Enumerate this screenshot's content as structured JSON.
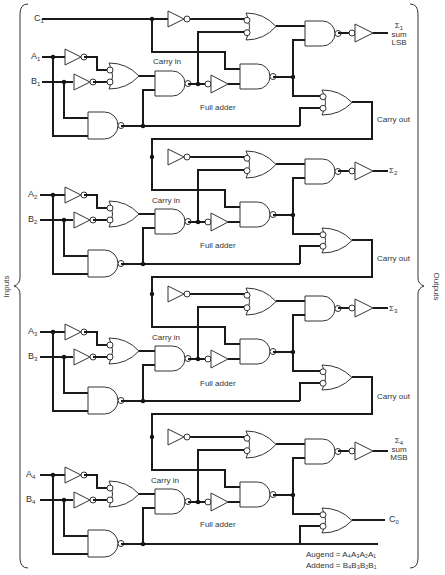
{
  "diagram": {
    "side_labels": {
      "left": "Inputs",
      "right": "Outputs"
    },
    "carry_input": {
      "name": "C",
      "sub": "1"
    },
    "stages": [
      {
        "a": {
          "name": "A",
          "sub": "1"
        },
        "b": {
          "name": "B",
          "sub": "1"
        },
        "carry_in_label": "Carry in",
        "block_label": "Full adder",
        "sum": {
          "symbol": "Σ",
          "sub": "1",
          "line2": "sum",
          "line3": "LSB"
        },
        "carry_out_label": "Carry out"
      },
      {
        "a": {
          "name": "A",
          "sub": "2"
        },
        "b": {
          "name": "B",
          "sub": "2"
        },
        "carry_in_label": "Carry in",
        "block_label": "Full adder",
        "sum": {
          "symbol": "Σ",
          "sub": "2",
          "line2": "",
          "line3": ""
        },
        "carry_out_label": "Carry out"
      },
      {
        "a": {
          "name": "A",
          "sub": "3"
        },
        "b": {
          "name": "B",
          "sub": "3"
        },
        "carry_in_label": "Carry in",
        "block_label": "Full adder",
        "sum": {
          "symbol": "Σ",
          "sub": "3",
          "line2": "",
          "line3": ""
        },
        "carry_out_label": "Carry out"
      },
      {
        "a": {
          "name": "A",
          "sub": "4"
        },
        "b": {
          "name": "B",
          "sub": "4"
        },
        "carry_in_label": "Carry in",
        "block_label": "Full adder",
        "sum": {
          "symbol": "Σ",
          "sub": "4",
          "line2": "sum",
          "line3": "MSB"
        },
        "carry_out_label": ""
      }
    ],
    "final_carry": {
      "name": "C",
      "sub": "0"
    },
    "notes": {
      "augend_label": "Augend",
      "augend_value": "A₄A₃A₂A₁",
      "addend_label": "Addend",
      "addend_value": "B₄B₃B₂B₁"
    },
    "colors": {
      "line": "#1a1a1a",
      "background": "#ffffff"
    }
  }
}
